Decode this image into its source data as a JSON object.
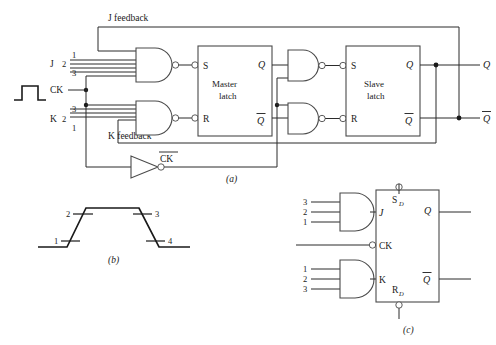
{
  "figure": {
    "panels": [
      {
        "id": "a",
        "caption": "(a)"
      },
      {
        "id": "b",
        "caption": "(b)"
      },
      {
        "id": "c",
        "caption": "(c)"
      }
    ]
  },
  "panel_a": {
    "feedback_labels": {
      "j_feedback": "J feedback",
      "k_feedback": "K feedback"
    },
    "inputs": {
      "j_label": "J",
      "k_label": "K",
      "ck_label": "CK",
      "ck_bar_label": "CK",
      "j_pin_numbers": [
        "1",
        "2",
        "3"
      ],
      "k_pin_numbers": [
        "3",
        "2",
        "1"
      ]
    },
    "master_latch": {
      "title_line1": "Master",
      "title_line2": "latch",
      "input_s": "S",
      "input_r": "R",
      "output_q": "Q",
      "output_qbar": "Q"
    },
    "slave_latch": {
      "title_line1": "Slave",
      "title_line2": "latch",
      "input_s": "S",
      "input_r": "R",
      "output_q": "Q",
      "output_qbar": "Q"
    },
    "outputs": {
      "q": "Q",
      "qbar": "Q"
    },
    "caption": "(a)"
  },
  "panel_b": {
    "markers": [
      "1",
      "2",
      "3",
      "4"
    ],
    "caption": "(b)",
    "waveform": {
      "description": "trapezoidal clock pulse",
      "points": [
        "low",
        "rise",
        "high",
        "fall",
        "low"
      ]
    }
  },
  "panel_c": {
    "j_gate_pins": [
      "3",
      "2",
      "1"
    ],
    "k_gate_pins": [
      "1",
      "2",
      "3"
    ],
    "labels": {
      "j": "J",
      "k": "K",
      "ck": "CK",
      "sd": "S",
      "sd_sub": "D",
      "rd": "R",
      "rd_sub": "D",
      "q": "Q",
      "qbar": "Q"
    },
    "caption": "(c)"
  },
  "colors": {
    "wire": "#2b2b2b",
    "outline": "#4a4a4a",
    "text": "#1a1a1a",
    "background": "#ffffff"
  }
}
